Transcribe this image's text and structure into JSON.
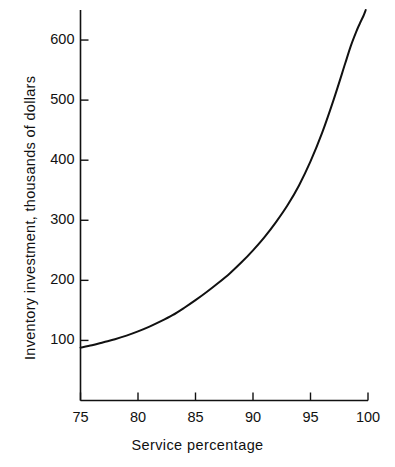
{
  "chart_data": {
    "type": "line",
    "title": "",
    "subtitle": "",
    "xlabel": "Service percentage",
    "ylabel": "Inventory investment, thousands of dollars",
    "xlim": [
      75,
      100
    ],
    "ylim": [
      0,
      650
    ],
    "xticks": [
      75,
      80,
      85,
      90,
      95,
      100
    ],
    "xtick_labels": [
      "75",
      "80",
      "85",
      "90",
      "95",
      "100"
    ],
    "yticks": [
      100,
      200,
      300,
      400,
      500,
      600
    ],
    "ytick_labels": [
      "100",
      "200",
      "300",
      "400",
      "500",
      "600"
    ],
    "grid": false,
    "legend": null,
    "annotations": [],
    "series": [
      {
        "name": "Inventory investment",
        "color": "#111111",
        "line_width": 2,
        "x": [
          75,
          76,
          77,
          78,
          79,
          80,
          81,
          82,
          83,
          84,
          85,
          86,
          87,
          88,
          89,
          90,
          91,
          92,
          93,
          94,
          95,
          96,
          97,
          98,
          98.5,
          99,
          99.3,
          99.6,
          99.8
        ],
        "values": [
          88,
          92,
          97,
          102,
          108,
          115,
          123,
          132,
          142,
          154,
          167,
          181,
          196,
          212,
          230,
          250,
          272,
          297,
          325,
          358,
          398,
          445,
          500,
          560,
          590,
          615,
          628,
          640,
          650
        ]
      }
    ]
  },
  "axes": {
    "y_axis_name": "inventory-investment-axis",
    "x_axis_name": "service-percentage-axis"
  }
}
